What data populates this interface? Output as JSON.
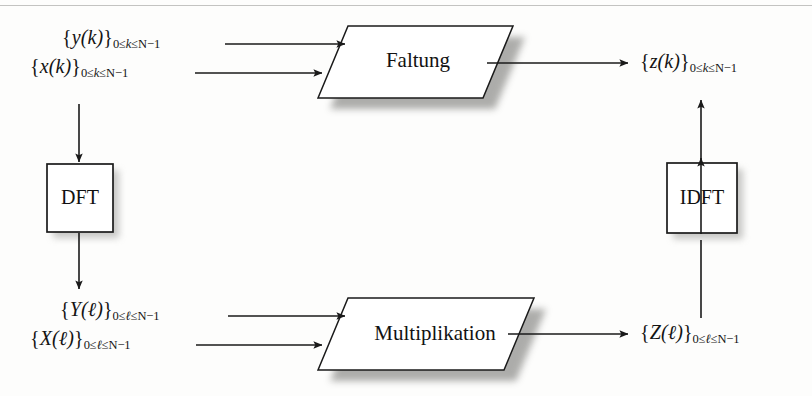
{
  "figure": {
    "type": "block-diagram",
    "language": "de",
    "background_color": "#fdfdfc",
    "line_color": "#1a1a1a",
    "shadow_color": "#9a9a97"
  },
  "signals": {
    "y_time": {
      "brace_open": "{",
      "name": "y",
      "arg_open": "(",
      "arg": "k",
      "arg_close": ")",
      "brace_close": "}",
      "range": "0≤k≤N−1",
      "range_prefix": "0≤",
      "range_var": "k",
      "range_suffix": "≤N−1"
    },
    "x_time": {
      "brace_open": "{",
      "name": "x",
      "arg_open": "(",
      "arg": "k",
      "arg_close": ")",
      "brace_close": "}",
      "range_prefix": "0≤",
      "range_var": "k",
      "range_suffix": "≤N−1"
    },
    "z_time": {
      "brace_open": "{",
      "name": "z",
      "arg_open": "(",
      "arg": "k",
      "arg_close": ")",
      "brace_close": "}",
      "range_prefix": "0≤",
      "range_var": "k",
      "range_suffix": "≤N−1"
    },
    "Y_freq": {
      "brace_open": "{",
      "name": "Y",
      "arg_open": "(",
      "arg": "ℓ",
      "arg_close": ")",
      "brace_close": "}",
      "range_prefix": "0≤",
      "range_var": "ℓ",
      "range_suffix": "≤N−1"
    },
    "X_freq": {
      "brace_open": "{",
      "name": "X",
      "arg_open": "(",
      "arg": "ℓ",
      "arg_close": ")",
      "brace_close": "}",
      "range_prefix": "0≤",
      "range_var": "ℓ",
      "range_suffix": "≤N−1"
    },
    "Z_freq": {
      "brace_open": "{",
      "name": "Z",
      "arg_open": "(",
      "arg": "ℓ",
      "arg_close": ")",
      "brace_close": "}",
      "range_prefix": "0≤",
      "range_var": "ℓ",
      "range_suffix": "≤N−1"
    }
  },
  "nodes": {
    "convolution": {
      "label": "Faltung",
      "shape": "parallelogram"
    },
    "multiplication": {
      "label": "Multiplikation",
      "shape": "parallelogram"
    },
    "dft": {
      "label": "DFT",
      "shape": "rectangle"
    },
    "idft": {
      "label": "IDFT",
      "shape": "rectangle"
    }
  },
  "edges": [
    {
      "from": "y_time",
      "to": "convolution"
    },
    {
      "from": "x_time",
      "to": "convolution"
    },
    {
      "from": "convolution",
      "to": "z_time"
    },
    {
      "from": "x_time",
      "to": "dft"
    },
    {
      "from": "dft",
      "to": "X_freq"
    },
    {
      "from": "Y_freq",
      "to": "multiplication"
    },
    {
      "from": "X_freq",
      "to": "multiplication"
    },
    {
      "from": "multiplication",
      "to": "Z_freq"
    },
    {
      "from": "Z_freq",
      "to": "idft"
    },
    {
      "from": "idft",
      "to": "z_time"
    }
  ]
}
